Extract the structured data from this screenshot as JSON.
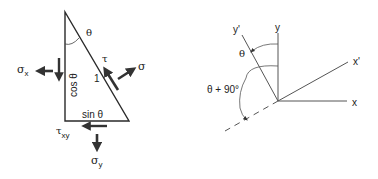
{
  "left_diagram": {
    "title": "stress element triangle",
    "labels": {
      "theta": "θ",
      "tau": "τ",
      "sigma": "σ",
      "hypotenuse": "1",
      "sigma_x_base": "σ",
      "sigma_x_sub": "x",
      "cos_theta": "cos θ",
      "sin_theta": "sin θ",
      "tau_xy_base": "τ",
      "tau_xy_sub": "xy",
      "sigma_y_base": "σ",
      "sigma_y_sub": "y"
    }
  },
  "right_diagram": {
    "title": "rotated axes",
    "labels": {
      "y": "y",
      "y_prime": "y'",
      "x": "x",
      "x_prime": "x'",
      "theta": "θ",
      "theta_plus_90": "θ + 90°"
    }
  },
  "colors": {
    "line": "#2a2a2a",
    "arrow": "#333333",
    "text": "#222222"
  }
}
